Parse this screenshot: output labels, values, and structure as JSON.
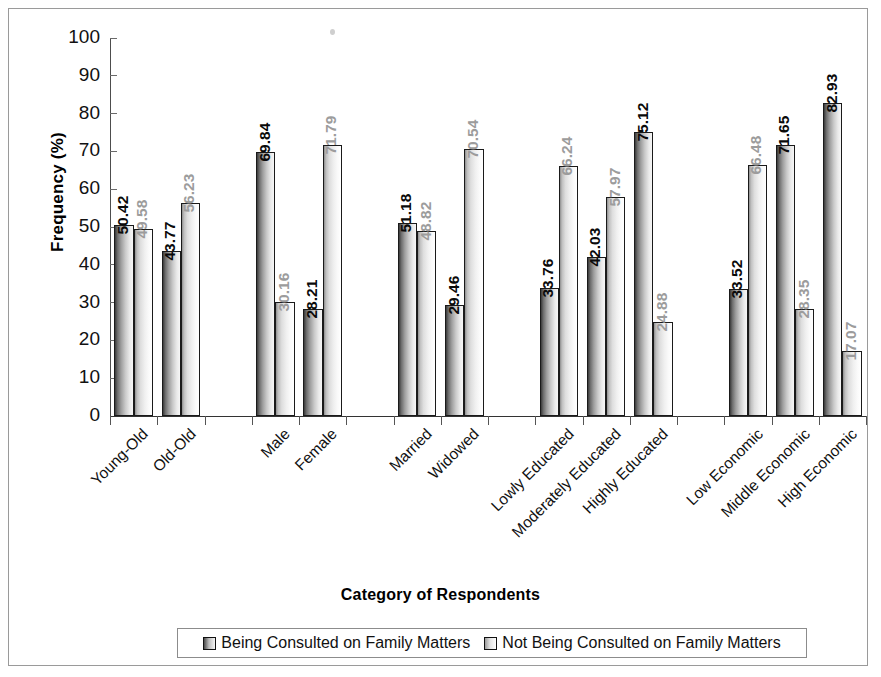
{
  "chart_data": {
    "type": "bar",
    "title": "",
    "xlabel": "Category of Respondents",
    "ylabel": "Frequency (%)",
    "ylim": [
      0,
      100
    ],
    "ytick_step": 10,
    "yticks": [
      0,
      10,
      20,
      30,
      40,
      50,
      60,
      70,
      80,
      90,
      100
    ],
    "grid": false,
    "legend_position": "bottom",
    "categories": [
      "Young-Old",
      "Old-Old",
      "Male",
      "Female",
      "Married",
      "Widowed",
      "Lowly Educated",
      "Moderately Educated",
      "Highly Educated",
      "Low Economic",
      "Middle Economic",
      "High Economic"
    ],
    "group_breaks_after": [
      1,
      3,
      5,
      8
    ],
    "series": [
      {
        "name": "Being Consulted on Family Matters",
        "color": "#6d6d6d",
        "label_color": "#0a0a0a",
        "values": [
          50.42,
          43.77,
          69.84,
          28.21,
          51.18,
          29.46,
          33.76,
          42.03,
          75.12,
          33.52,
          71.65,
          82.93
        ],
        "labels": [
          "50.42",
          "43.77",
          "69.84",
          "28.21",
          "51.18",
          "29.46",
          "33.76",
          "42.03",
          "75.12",
          "33.52",
          "71.65",
          "82.93"
        ]
      },
      {
        "name": "Not Being Consulted on Family Matters",
        "color": "#d6d6d6",
        "label_color": "#9c9c9c",
        "values": [
          49.58,
          56.23,
          30.16,
          71.79,
          48.82,
          70.54,
          66.24,
          57.97,
          24.88,
          66.48,
          28.35,
          17.07
        ],
        "labels": [
          "49.58",
          "56.23",
          "30.16",
          "71.79",
          "48.82",
          "70.54",
          "66.24",
          "57.97",
          "24.88",
          "66.48",
          "28.35",
          "17.07"
        ]
      }
    ]
  },
  "legend": {
    "items": [
      {
        "label": "Being Consulted on Family Matters"
      },
      {
        "label": "Not Being Consulted on Family Matters"
      }
    ]
  },
  "axes": {
    "y_title": "Frequency (%)",
    "x_title": "Category of Respondents",
    "y_tick_labels": [
      "100",
      "90",
      "80",
      "70",
      "60",
      "50",
      "40",
      "30",
      "20",
      "10",
      "0"
    ]
  }
}
